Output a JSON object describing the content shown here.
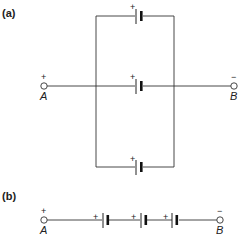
{
  "figure": {
    "panel_a": {
      "label": "(a)",
      "description": "Three batteries connected in parallel between terminals A and B",
      "terminal_a": {
        "name": "A",
        "polarity": "+"
      },
      "terminal_b": {
        "name": "B",
        "polarity": "−"
      },
      "battery_polarity": "+",
      "battery_count": 3
    },
    "panel_b": {
      "label": "(b)",
      "description": "Three batteries connected in series between terminals A and B",
      "terminal_a": {
        "name": "A",
        "polarity": "+"
      },
      "terminal_b": {
        "name": "B",
        "polarity": "−"
      },
      "battery_polarity": "+",
      "battery_count": 3
    }
  }
}
